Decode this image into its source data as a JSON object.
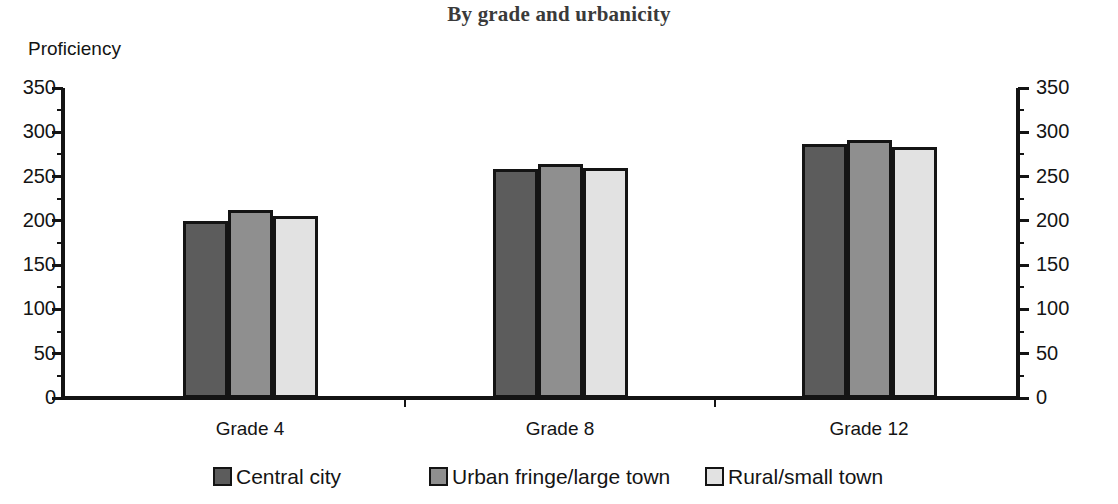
{
  "chart_data": {
    "type": "bar",
    "title": "By grade and urbanicity",
    "xlabel": "",
    "ylabel": "Proficiency",
    "ylim": [
      0,
      350
    ],
    "ytick_step": 50,
    "yminor_step": 25,
    "grid": false,
    "legend_position": "bottom",
    "dual_y_axis": true,
    "categories": [
      "Grade 4",
      "Grade 8",
      "Grade 12"
    ],
    "ytick_labels": [
      "0",
      "50",
      "100",
      "150",
      "200",
      "250",
      "300",
      "350"
    ],
    "ytick_values": [
      0,
      50,
      100,
      150,
      200,
      250,
      300,
      350
    ],
    "series": [
      {
        "name": "Central city",
        "color": "#5c5c5c",
        "values": [
          200,
          258,
          287
        ]
      },
      {
        "name": "Urban fringe/large town",
        "color": "#8f8f8f",
        "values": [
          212,
          264,
          291
        ]
      },
      {
        "name": "Rural/small town",
        "color": "#e2e2e2",
        "values": [
          205,
          260,
          283
        ]
      }
    ]
  },
  "axis": {
    "y_left_label": "Proficiency",
    "y_left_ticks": [
      "350",
      "300",
      "250",
      "200",
      "150",
      "100",
      "50",
      "0"
    ],
    "y_right_ticks": [
      "350",
      "300",
      "250",
      "200",
      "150",
      "100",
      "50",
      "0"
    ]
  },
  "legend": {
    "items": [
      {
        "label": "Central city",
        "color": "#5c5c5c"
      },
      {
        "label": "Urban fringe/large town",
        "color": "#8f8f8f"
      },
      {
        "label": "Rural/small town",
        "color": "#e2e2e2"
      }
    ]
  },
  "colors": {
    "axis_line": "#141414",
    "bar_outline": "#141414",
    "title_text": "#3a3a3a",
    "body_text": "#141414",
    "background": "#ffffff"
  }
}
